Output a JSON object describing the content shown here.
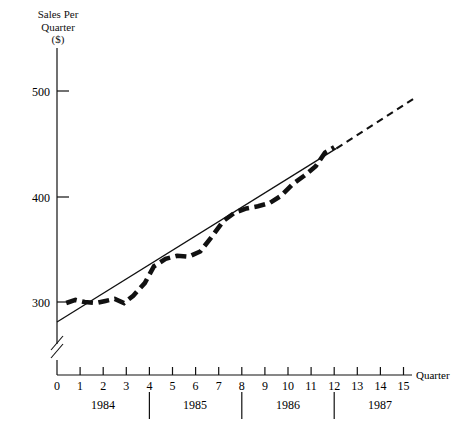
{
  "chart_data": {
    "type": "line",
    "title": "",
    "ylabel": "Sales Per Quarter ($)",
    "ylabel_lines": [
      "Sales Per",
      "Quarter",
      "($)"
    ],
    "xlabel": "Quarter",
    "ylim": [
      270,
      530
    ],
    "xlim": [
      0,
      15.8
    ],
    "grid": false,
    "legend": "none",
    "y_ticks": [
      300,
      400,
      500
    ],
    "x_ticks": [
      0,
      1,
      2,
      3,
      4,
      5,
      6,
      7,
      8,
      9,
      10,
      11,
      12,
      13,
      14,
      15
    ],
    "y_axis_break": true,
    "group_labels": [
      "1984",
      "1985",
      "1986",
      "1987"
    ],
    "group_separators": [
      4,
      8,
      12
    ],
    "series": [
      {
        "name": "Actual sales (seasonal)",
        "style": "thick-dashed",
        "x": [
          0.4,
          0.8,
          1.2,
          1.7,
          2.1,
          2.5,
          2.9,
          3.3,
          3.8,
          4.2,
          4.7,
          5.2,
          5.7,
          6.2,
          6.7,
          7.2,
          7.7,
          8.2,
          8.7,
          9.2,
          9.7,
          10.2,
          10.7,
          11.2,
          11.6,
          12.0
        ],
        "values": [
          299,
          302,
          300,
          299,
          301,
          303,
          299,
          306,
          318,
          334,
          341,
          344,
          343,
          348,
          362,
          377,
          385,
          389,
          391,
          394,
          401,
          412,
          420,
          429,
          442,
          447
        ]
      },
      {
        "name": "Trend line (fitted)",
        "style": "thin-solid",
        "x": [
          0,
          12.1
        ],
        "values": [
          281,
          446
        ]
      },
      {
        "name": "Trend projection",
        "style": "thin-dashed",
        "x": [
          12.1,
          15.5
        ],
        "values": [
          446,
          494
        ]
      }
    ]
  },
  "axis": {
    "y_tick_labels": [
      "500",
      "400",
      "300"
    ],
    "x_tick_labels": [
      "0",
      "1",
      "2",
      "3",
      "4",
      "5",
      "6",
      "7",
      "8",
      "9",
      "10",
      "11",
      "12",
      "13",
      "14",
      "15"
    ],
    "x_axis_name": "Quarter"
  },
  "years": [
    {
      "label": "1984"
    },
    {
      "label": "1985"
    },
    {
      "label": "1986"
    },
    {
      "label": "1987"
    }
  ],
  "colors": {
    "ink": "#111111",
    "background": "#ffffff"
  }
}
